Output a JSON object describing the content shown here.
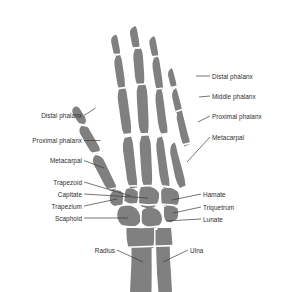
{
  "figure": {
    "view": "palmar",
    "background_color": "#ffffff",
    "bone_color": "#808080",
    "bone_gap_color": "#ffffff",
    "label_color": "#2e2e2e",
    "leader_line_color": "#3b3b3b"
  },
  "labels": {
    "left": [
      {
        "id": "distal-phalanx-thumb",
        "text": "Distal phalanx"
      },
      {
        "id": "proximal-phalanx-thumb",
        "text": "Proximal phalanx"
      },
      {
        "id": "metacarpal-thumb",
        "text": "Metacarpal"
      },
      {
        "id": "trapezoid",
        "text": "Trapezoid"
      },
      {
        "id": "capitate",
        "text": "Capitate"
      },
      {
        "id": "trapezium",
        "text": "Trapezium"
      },
      {
        "id": "scaphoid",
        "text": "Scaphoid"
      },
      {
        "id": "radius",
        "text": "Radius"
      }
    ],
    "right": [
      {
        "id": "distal-phalanx-little",
        "text": "Distal phalanx"
      },
      {
        "id": "middle-phalanx-little",
        "text": "Middle phalanx"
      },
      {
        "id": "proximal-phalanx-little",
        "text": "Proximal phalanx"
      },
      {
        "id": "metacarpal-little",
        "text": "Metacarpal"
      },
      {
        "id": "hamate",
        "text": "Hamate"
      },
      {
        "id": "triquetrum",
        "text": "Triquetrum"
      },
      {
        "id": "lunate",
        "text": "Lunate"
      },
      {
        "id": "ulna",
        "text": "Ulna"
      }
    ]
  }
}
